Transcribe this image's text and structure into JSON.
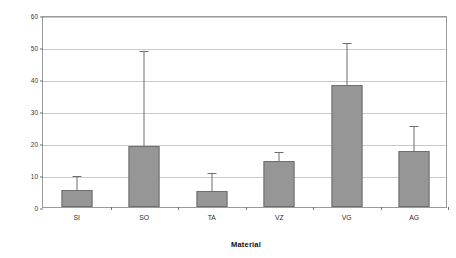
{
  "chart_data": {
    "type": "bar",
    "title": "",
    "xlabel": "Material",
    "ylabel": "Percentage (%)",
    "categories": [
      "SI",
      "SO",
      "TA",
      "VZ",
      "VG",
      "AG"
    ],
    "values": [
      5.4,
      19.2,
      5.0,
      14.3,
      38.0,
      17.5
    ],
    "error_upper": [
      9.5,
      48.5,
      10.3,
      16.8,
      51.0,
      25.0
    ],
    "series": [
      {
        "name": "Percentage",
        "values": [
          5.4,
          19.2,
          5.0,
          14.3,
          38.0,
          17.5
        ],
        "error_upper": [
          9.5,
          48.5,
          10.3,
          16.8,
          51.0,
          25.0
        ]
      }
    ],
    "ylim": [
      0,
      60
    ],
    "ytick_labels": [
      "0",
      "10",
      "20",
      "30",
      "40",
      "50",
      "60"
    ],
    "ytick_values": [
      0,
      10,
      20,
      30,
      40,
      50,
      60
    ],
    "grid": "horizontal",
    "legend": "none",
    "colors": {
      "bar_fill": "#969696",
      "bar_border": "#6e6e6e",
      "gridline": "#c9c9c9",
      "axis": "#9a9a9a",
      "background": "#ffffff",
      "text": "#1a1a1a"
    }
  }
}
